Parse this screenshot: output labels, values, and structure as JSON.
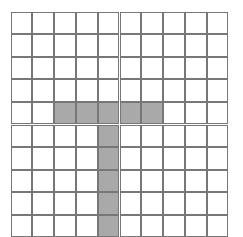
{
  "grid": {
    "cols": 10,
    "rows": 11,
    "cell_width": 21.8,
    "cell_height": 22.6,
    "line_color": "#777777",
    "fill_color": "#a9a9a9",
    "background": "#ffffff",
    "filled_cells": [
      [
        4,
        2
      ],
      [
        4,
        3
      ],
      [
        4,
        4
      ],
      [
        4,
        5
      ],
      [
        4,
        6
      ],
      [
        5,
        4
      ],
      [
        6,
        4
      ],
      [
        7,
        4
      ],
      [
        8,
        4
      ],
      [
        9,
        4
      ],
      [
        10,
        4
      ]
    ],
    "shape": "T"
  }
}
